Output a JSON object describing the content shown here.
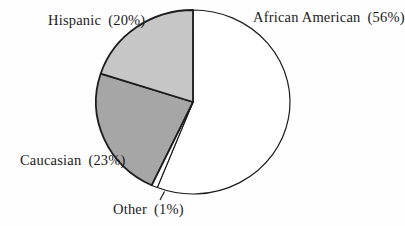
{
  "chart_data": {
    "type": "pie",
    "title": "",
    "categories": [
      "African American",
      "Other",
      "Caucasian",
      "Hispanic"
    ],
    "values": [
      56,
      1,
      23,
      20
    ],
    "unit": "%",
    "direction": "clockwise",
    "start_angle_deg": 0,
    "legend_position": "none",
    "outline_color": "#1c1c1c",
    "background_color": "#fefefe",
    "slices": [
      {
        "label": "African American",
        "pct_label": "(56%)",
        "value": 56,
        "color": "#ffffff"
      },
      {
        "label": "Other",
        "pct_label": "(1%)",
        "value": 1,
        "color": "#ffffff"
      },
      {
        "label": "Caucasian",
        "pct_label": "(23%)",
        "value": 23,
        "color": "#a6a6a6"
      },
      {
        "label": "Hispanic",
        "pct_label": "(20%)",
        "value": 20,
        "color": "#c6c6c6"
      }
    ]
  }
}
